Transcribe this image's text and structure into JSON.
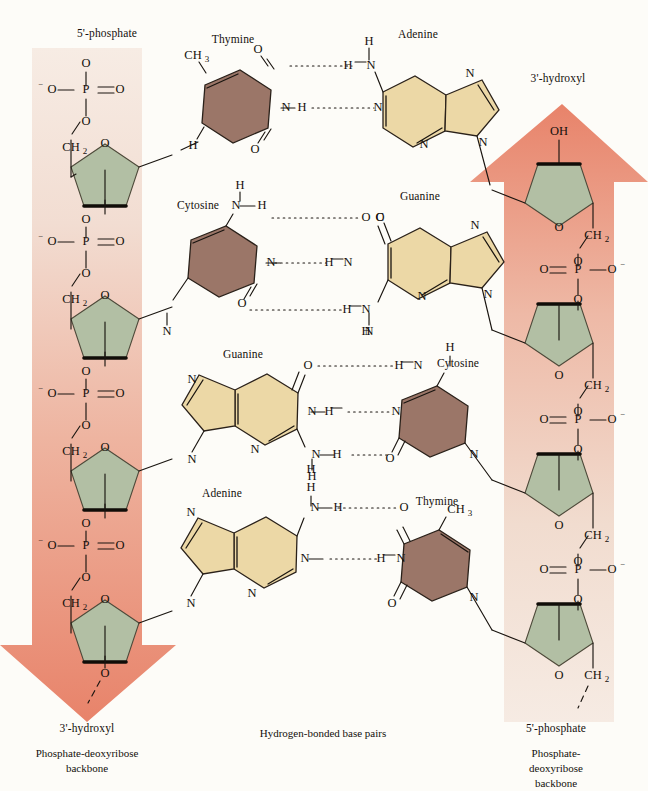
{
  "figure": {
    "title_caption": "Hydrogen-bonded base pairs",
    "colors": {
      "purine": "#ecd8a6",
      "pyrimidine": "#9b7668",
      "sugar": "#b2bfa4",
      "arrow_coral": "#e8836a",
      "strand_pale": "#f3e3d8",
      "bond": "#1a1510",
      "page_bg": "#fdfcf8"
    }
  },
  "labels": {
    "left_top": "5'-phosphate",
    "left_bottom": "3'-hydroxyl",
    "right_top": "3'-hydroxyl",
    "right_bottom": "5'-phosphate",
    "left_backbone_caption": "Phosphate-deoxyribose\nbackbone",
    "right_backbone_caption": "Phosphate-deoxyribose\nbackbone",
    "center_caption": "Hydrogen-bonded base pairs"
  },
  "atoms": {
    "P": "P",
    "O": "O",
    "N": "N",
    "H": "H",
    "OH": "OH",
    "CH2": "CH",
    "CH3": "CH",
    "sub2": "2",
    "sub3": "3",
    "minus": "−"
  },
  "base_pairs": [
    {
      "index": 0,
      "left": {
        "name": "Thymine",
        "class": "pyrimidine"
      },
      "right": {
        "name": "Adenine",
        "class": "purine"
      },
      "hydrogen_bonds": 2,
      "y": 110
    },
    {
      "index": 1,
      "left": {
        "name": "Cytosine",
        "class": "pyrimidine"
      },
      "right": {
        "name": "Guanine",
        "class": "purine"
      },
      "hydrogen_bonds": 3,
      "y": 262
    },
    {
      "index": 2,
      "left": {
        "name": "Guanine",
        "class": "purine"
      },
      "right": {
        "name": "Cytosine",
        "class": "pyrimidine"
      },
      "hydrogen_bonds": 3,
      "y": 412
    },
    {
      "index": 3,
      "left": {
        "name": "Adenine",
        "class": "purine"
      },
      "right": {
        "name": "Thymine",
        "class": "pyrimidine"
      },
      "hydrogen_bonds": 2,
      "y": 555
    }
  ],
  "strands": [
    {
      "id": "left",
      "direction": "5'-to-3' downward",
      "arrow": "down",
      "terminus_top": "5'-phosphate",
      "terminus_bottom": "3'-hydroxyl",
      "sugar_count": 4,
      "phosphate_count": 4
    },
    {
      "id": "right",
      "direction": "5'-to-3' upward",
      "arrow": "up",
      "terminus_top": "3'-hydroxyl",
      "terminus_bottom": "5'-phosphate",
      "sugar_count": 4,
      "phosphate_count": 4
    }
  ]
}
